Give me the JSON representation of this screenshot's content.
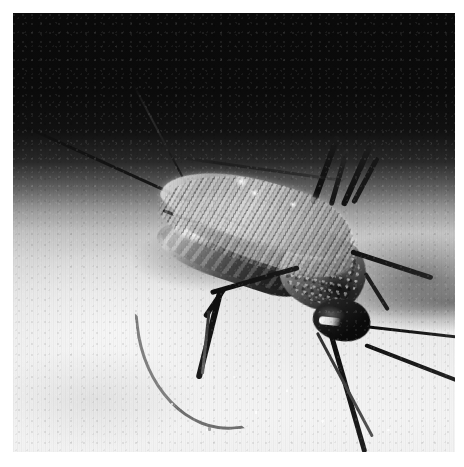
{
  "page": {
    "background_color": "#ffffff",
    "width": 464,
    "height": 467
  },
  "photograph": {
    "subject": "mosquito",
    "caption": "",
    "medium": "black-and-white macro photograph",
    "orientation": "landscape-square",
    "plate": {
      "left": 13,
      "top": 13,
      "width": 442,
      "height": 439
    },
    "tones": {
      "background_dark": "#0a0a0a",
      "background_mid": "#9c9c9c",
      "skin_light": "#f2f2f2",
      "body_dark": "#0d0d0d",
      "wing_light": "#e8e8e8",
      "highlight": "#ffffff"
    },
    "scene": {
      "surface": "human skin",
      "lighting": "top-down, background falls off to black"
    },
    "anatomy": [
      {
        "id": "antenna-upper",
        "label": "upper antenna"
      },
      {
        "id": "antenna-lower",
        "label": "lower antenna"
      },
      {
        "id": "palp",
        "label": "maxillary palp"
      },
      {
        "id": "abdomen",
        "label": "abdomen"
      },
      {
        "id": "thorax",
        "label": "thorax"
      },
      {
        "id": "head",
        "label": "head"
      },
      {
        "id": "eye",
        "label": "compound eye"
      },
      {
        "id": "proboscis",
        "label": "proboscis"
      },
      {
        "id": "wing-upper",
        "label": "upper wing"
      },
      {
        "id": "wing-lower",
        "label": "lower wing"
      },
      {
        "id": "legs",
        "label": "legs"
      }
    ]
  }
}
